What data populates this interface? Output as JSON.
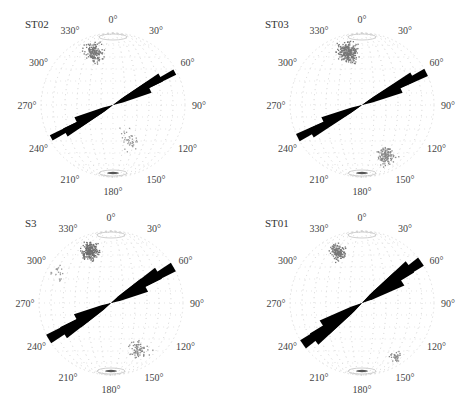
{
  "figure": {
    "panels": [
      {
        "id": "ST02",
        "title": "ST02",
        "center": [
          113,
          105
        ],
        "radius": 72,
        "rose_azimuth_deg": 62,
        "rose_petals": [
          {
            "az": 62,
            "len": 70,
            "w": 6
          },
          {
            "az": 60,
            "len": 55,
            "w": 9
          },
          {
            "az": 64,
            "len": 40,
            "w": 12
          },
          {
            "az": 242,
            "len": 70,
            "w": 6
          },
          {
            "az": 240,
            "len": 55,
            "w": 9
          },
          {
            "az": 244,
            "len": 40,
            "w": 12
          }
        ],
        "pole_clusters": [
          {
            "az": 340,
            "r": 0.78,
            "spread": 0.18,
            "count": 160,
            "color": "#777777"
          },
          {
            "az": 155,
            "r": 0.55,
            "spread": 0.25,
            "count": 40,
            "color": "#999999"
          }
        ]
      },
      {
        "id": "ST03",
        "title": "ST03",
        "center": [
          362,
          105
        ],
        "radius": 72,
        "rose_azimuth_deg": 63,
        "rose_petals": [
          {
            "az": 63,
            "len": 72,
            "w": 8
          },
          {
            "az": 61,
            "len": 58,
            "w": 10
          },
          {
            "az": 65,
            "len": 42,
            "w": 12
          },
          {
            "az": 243,
            "len": 72,
            "w": 8
          },
          {
            "az": 241,
            "len": 58,
            "w": 10
          },
          {
            "az": 245,
            "len": 42,
            "w": 12
          }
        ],
        "pole_clusters": [
          {
            "az": 345,
            "r": 0.75,
            "spread": 0.2,
            "count": 260,
            "color": "#777777"
          },
          {
            "az": 155,
            "r": 0.78,
            "spread": 0.18,
            "count": 120,
            "color": "#888888"
          }
        ]
      },
      {
        "id": "S3",
        "title": "S3",
        "center": [
          111,
          303
        ],
        "radius": 72,
        "rose_azimuth_deg": 60,
        "rose_petals": [
          {
            "az": 60,
            "len": 72,
            "w": 10
          },
          {
            "az": 58,
            "len": 56,
            "w": 13
          },
          {
            "az": 62,
            "len": 38,
            "w": 15
          },
          {
            "az": 240,
            "len": 72,
            "w": 10
          },
          {
            "az": 238,
            "len": 56,
            "w": 13
          },
          {
            "az": 242,
            "len": 38,
            "w": 15
          }
        ],
        "pole_clusters": [
          {
            "az": 338,
            "r": 0.78,
            "spread": 0.17,
            "count": 220,
            "color": "#6f6f6f"
          },
          {
            "az": 150,
            "r": 0.75,
            "spread": 0.2,
            "count": 70,
            "color": "#888888"
          },
          {
            "az": 300,
            "r": 0.85,
            "spread": 0.15,
            "count": 20,
            "color": "#999999"
          }
        ]
      },
      {
        "id": "ST01",
        "title": "ST01",
        "center": [
          362,
          303
        ],
        "radius": 72,
        "rose_azimuth_deg": 55,
        "rose_petals": [
          {
            "az": 55,
            "len": 72,
            "w": 10
          },
          {
            "az": 53,
            "len": 60,
            "w": 14
          },
          {
            "az": 57,
            "len": 45,
            "w": 17
          },
          {
            "az": 235,
            "len": 72,
            "w": 10
          },
          {
            "az": 233,
            "len": 60,
            "w": 14
          },
          {
            "az": 237,
            "len": 45,
            "w": 17
          }
        ],
        "pole_clusters": [
          {
            "az": 335,
            "r": 0.78,
            "spread": 0.15,
            "count": 150,
            "color": "#777777"
          },
          {
            "az": 148,
            "r": 0.88,
            "spread": 0.1,
            "count": 35,
            "color": "#888888"
          }
        ]
      }
    ],
    "degree_labels": [
      "0°",
      "30°",
      "60°",
      "90°",
      "120°",
      "150°",
      "180°",
      "210°",
      "240°",
      "270°",
      "300°",
      "330°"
    ],
    "colors": {
      "rose": "#000000",
      "grid": "#d8d8d8",
      "label": "#444444"
    }
  }
}
